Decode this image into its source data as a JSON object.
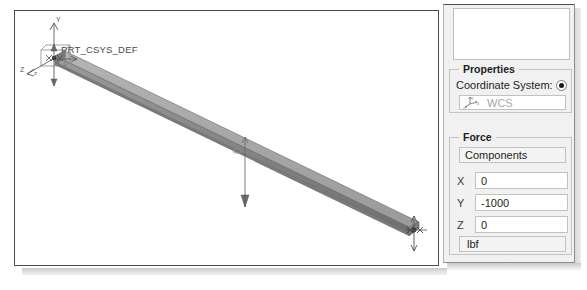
{
  "viewport": {
    "name": "graphics-viewport",
    "background": "#ffffff",
    "csys_label": "PRT_CSYS_DEF",
    "triad_axes": {
      "y": "Y",
      "x": "X",
      "z": "Z"
    },
    "beam_color": "#8a8a8a",
    "beam_edge_color": "#5b5b5b"
  },
  "panel": {
    "list_placeholder": "",
    "properties": {
      "group_title": "Properties",
      "coordinate_system_label": "Coordinate System:",
      "coordinate_system_value": "WCS",
      "radio_selected": true
    },
    "force": {
      "group_title": "Force",
      "type_value": "Components",
      "components": [
        {
          "axis": "X",
          "value": "0"
        },
        {
          "axis": "Y",
          "value": "-1000"
        },
        {
          "axis": "Z",
          "value": "0"
        }
      ],
      "units_value": "lbf"
    }
  },
  "colors": {
    "panel_bg": "#f1f1f1",
    "field_bg": "#ffffff",
    "border": "#c2c2c2",
    "disabled_text": "#a8a8a8"
  }
}
